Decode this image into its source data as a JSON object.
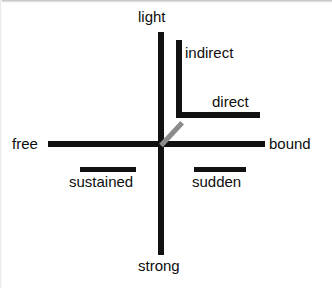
{
  "diagram": {
    "background_color": "#ffffff",
    "axis_color": "#111111",
    "connector_color": "#8b8b8b",
    "text_color": "#0d0d0d",
    "axes": [
      {
        "name": "weight-axis",
        "orientation": "vertical",
        "positive_label": "light",
        "negative_label": "strong"
      },
      {
        "name": "flow-axis",
        "orientation": "horizontal",
        "positive_label": "free",
        "negative_label": "bound"
      },
      {
        "name": "space-axis",
        "orientation": "diagonal",
        "positive_label": "indirect",
        "negative_label": "direct"
      },
      {
        "name": "time-axis",
        "orientation": "bars",
        "positive_label": "sustained",
        "negative_label": "sudden"
      }
    ],
    "labels": {
      "light": "light",
      "indirect": "indirect",
      "direct": "direct",
      "free": "free",
      "bound": "bound",
      "sustained": "sustained",
      "sudden": "sudden",
      "strong": "strong"
    }
  }
}
